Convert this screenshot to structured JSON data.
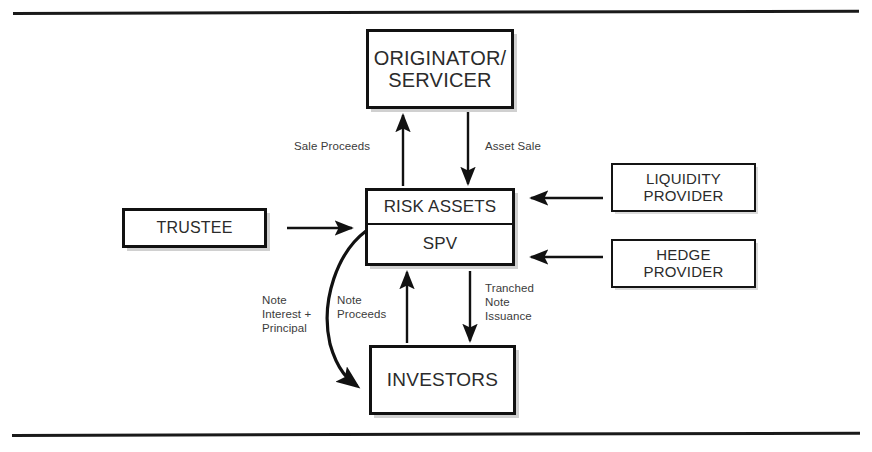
{
  "diagram": {
    "colors": {
      "line": "#111111",
      "box_text": "#2b2b2b",
      "label_text": "#3b3b3b",
      "background": "#ffffff",
      "shadow": "#9a9a9a"
    },
    "boxes": {
      "originator": {
        "label": "ORIGINATOR/\nSERVICER"
      },
      "spv": {
        "top_label": "RISK ASSETS",
        "bottom_label": "SPV"
      },
      "trustee": {
        "label": "TRUSTEE"
      },
      "liquidity_provider": {
        "label": "LIQUIDITY\nPROVIDER"
      },
      "hedge_provider": {
        "label": "HEDGE\nPROVIDER"
      },
      "investors": {
        "label": "INVESTORS"
      }
    },
    "flow_labels": {
      "sale_proceeds": "Sale Proceeds",
      "asset_sale": "Asset Sale",
      "note_interest_principal": "Note\nInterest +\nPrincipal",
      "note_proceeds": "Note\nProceeds",
      "tranched_note_issuance": "Tranched\nNote\nIssuance"
    },
    "connections": [
      {
        "from": "spv",
        "to": "originator",
        "label": "Sale Proceeds",
        "style": "straight-up"
      },
      {
        "from": "originator",
        "to": "spv",
        "label": "Asset Sale",
        "style": "straight-down"
      },
      {
        "from": "trustee",
        "to": "spv",
        "label": "",
        "style": "straight-right"
      },
      {
        "from": "liquidity_provider",
        "to": "spv",
        "label": "",
        "style": "straight-left"
      },
      {
        "from": "hedge_provider",
        "to": "spv",
        "label": "",
        "style": "straight-left"
      },
      {
        "from": "investors",
        "to": "spv",
        "label": "Note Proceeds",
        "style": "straight-up"
      },
      {
        "from": "spv",
        "to": "investors",
        "label": "Tranched Note Issuance",
        "style": "straight-down"
      },
      {
        "from": "spv",
        "to": "investors",
        "label": "Note Interest + Principal",
        "style": "curved-left-down"
      }
    ]
  }
}
